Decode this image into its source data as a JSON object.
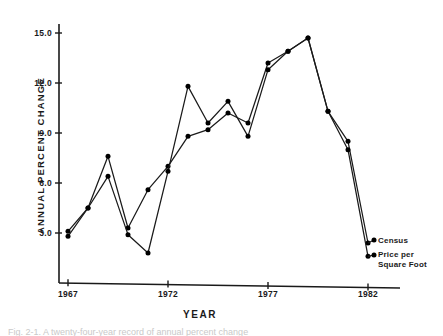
{
  "figure": {
    "caption_fragment": "Fig. 2-1.  A twenty-four-year record of annual percent change"
  },
  "axes": {
    "ylabel": "ANNUAL PERCENT CHANGE",
    "xlabel": "YEAR",
    "ytick_labels": [
      "3.0",
      "6.0",
      "9.0",
      "12.0",
      "15.0"
    ],
    "xtick_labels": [
      "1967",
      "1972",
      "1977",
      "1982"
    ]
  },
  "legend": {
    "census_label": "Census",
    "price_label_line1": "Price per",
    "price_label_line2": "Square Foot"
  },
  "colors": {
    "ink": "#1a1a1a",
    "background": "#ffffff",
    "marker": "#000000"
  },
  "chart_data": {
    "type": "line",
    "title": "",
    "xlabel": "YEAR",
    "ylabel": "ANNUAL PERCENT CHANGE",
    "xlim": [
      1967,
      1982
    ],
    "ylim": [
      0.9,
      16.2
    ],
    "yticks": [
      3.0,
      6.0,
      9.0,
      12.0,
      15.0
    ],
    "xticks": [
      1967,
      1972,
      1977,
      1982
    ],
    "grid": false,
    "legend_position": "right-of-line-ends",
    "x": [
      1967,
      1968,
      1969,
      1970,
      1971,
      1972,
      1973,
      1974,
      1975,
      1976,
      1977,
      1978,
      1979,
      1980,
      1981,
      1982
    ],
    "series": [
      {
        "name": "Census",
        "values": [
          3.1,
          4.5,
          7.6,
          3.3,
          5.6,
          7.0,
          8.8,
          9.2,
          10.2,
          9.6,
          13.2,
          13.9,
          14.7,
          10.3,
          8.5,
          2.4
        ]
      },
      {
        "name": "Price per Square Foot",
        "values": [
          2.8,
          4.5,
          6.4,
          2.9,
          1.8,
          6.7,
          11.8,
          9.6,
          10.9,
          8.8,
          12.8,
          13.9,
          14.7,
          10.3,
          8.0,
          1.6
        ]
      }
    ]
  }
}
